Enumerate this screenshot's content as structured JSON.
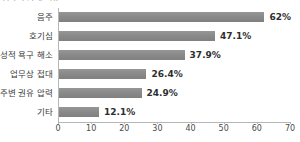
{
  "chart_data": {
    "type": "bar",
    "orientation": "horizontal",
    "title": "성폭력 가해 이유",
    "categories": [
      "음주",
      "호기심",
      "성적 욕구 해소",
      "업무상 접대",
      "주변 권유 압력",
      "기타"
    ],
    "values": [
      62,
      47.1,
      37.9,
      26.4,
      24.9,
      12.1
    ],
    "value_labels": [
      "62%",
      "47.1%",
      "37.9%",
      "26.4%",
      "24.9%",
      "12.1%"
    ],
    "xlabel": "",
    "ylabel": "",
    "xlim": [
      0,
      70
    ],
    "xticks": [
      0,
      10,
      20,
      30,
      40,
      50,
      60,
      70
    ],
    "xtick_labels": [
      "0",
      "10",
      "20",
      "30",
      "40",
      "50",
      "60",
      "70"
    ],
    "grid": false,
    "legend": false,
    "bar_color": "#8a8a8a",
    "background_color": "#ffffff",
    "axis_color": "#b6b6b6"
  }
}
